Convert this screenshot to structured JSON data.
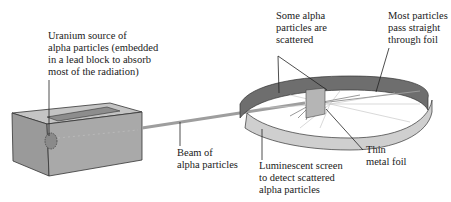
{
  "diagram": {
    "colors": {
      "block_front": "#a9a9a9",
      "block_top": "#c4c4c4",
      "block_side": "#9a9a9a",
      "beam": "#9e9e9e",
      "ring_inner_dark": "#6e6e6e",
      "ring_outer_light": "#cfcfcf",
      "foil": "#b5b5b5",
      "leader_line": "#222222"
    },
    "labels": {
      "source": [
        "Uranium source of",
        "alpha particles (embedded",
        "in a lead block to absorb",
        "most of the radiation)"
      ],
      "scattered": [
        "Some alpha",
        "particles are",
        "scattered"
      ],
      "straight": [
        "Most particles",
        "pass straight",
        "through foil"
      ],
      "foil": [
        "Thin",
        "metal foil"
      ],
      "beam": [
        "Beam of",
        "alpha particles"
      ],
      "screen": [
        "Luminescent screen",
        "to detect scattered",
        "alpha particles"
      ]
    }
  }
}
